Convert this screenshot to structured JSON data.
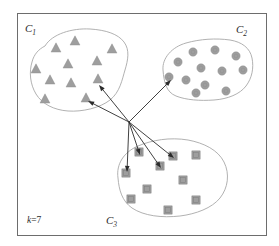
{
  "figure": {
    "k_label_prefix": "k",
    "k_label_rest": "=7",
    "frame": {
      "x": 17,
      "y": 13,
      "width": 249,
      "height": 222
    },
    "colors": {
      "frame_stroke": "#6d6d6d",
      "blob_stroke": "#a8a8a8",
      "marker_fill": "#9e9e9e",
      "arrow_stroke": "#2b2b2b",
      "background": "#ffffff",
      "text": "#2b2b2b"
    }
  },
  "labels": [
    {
      "name": "cluster-label-c1",
      "base": "C",
      "sub": "1",
      "x": 25,
      "y": 32
    },
    {
      "name": "cluster-label-c2",
      "base": "C",
      "sub": "2",
      "x": 236,
      "y": 33
    },
    {
      "name": "cluster-label-c3",
      "base": "C",
      "sub": "3",
      "x": 106,
      "y": 224
    },
    {
      "name": "k-value-label",
      "base": "k",
      "sub": "",
      "x": 27,
      "y": 223
    }
  ],
  "clusters": [
    {
      "id": "C1",
      "label": "C1",
      "shape": "triangle",
      "outline": "M 45,46 C 52,34 72,28 90,29 C 106,30 118,34 124,42 C 130,50 128,60 125,70 C 122,80 120,92 110,100 C 100,108 82,112 68,111 C 54,110 42,104 36,94 C 30,84 29,72 32,62 C 34,54 39,49 45,46 Z",
      "points": [
        {
          "x": 75,
          "y": 41
        },
        {
          "x": 56,
          "y": 48
        },
        {
          "x": 112,
          "y": 49
        },
        {
          "x": 68,
          "y": 64
        },
        {
          "x": 97,
          "y": 61
        },
        {
          "x": 36,
          "y": 69
        },
        {
          "x": 98,
          "y": 79
        },
        {
          "x": 50,
          "y": 80
        },
        {
          "x": 71,
          "y": 83
        },
        {
          "x": 45,
          "y": 99
        },
        {
          "x": 86,
          "y": 98
        }
      ]
    },
    {
      "id": "C2",
      "label": "C2",
      "shape": "circle",
      "outline": "M 163,70 C 162,58 172,47 186,43 C 200,39 216,38 230,40 C 242,42 250,48 252,58 C 254,68 252,78 246,86 C 240,94 228,99 214,100 C 200,101 186,100 176,96 C 166,92 164,82 163,70 Z",
      "points": [
        {
          "x": 193,
          "y": 52
        },
        {
          "x": 215,
          "y": 50
        },
        {
          "x": 236,
          "y": 56
        },
        {
          "x": 178,
          "y": 62
        },
        {
          "x": 201,
          "y": 68
        },
        {
          "x": 169,
          "y": 77
        },
        {
          "x": 222,
          "y": 71
        },
        {
          "x": 243,
          "y": 70
        },
        {
          "x": 186,
          "y": 80
        },
        {
          "x": 205,
          "y": 85
        },
        {
          "x": 196,
          "y": 93
        },
        {
          "x": 226,
          "y": 91
        }
      ]
    },
    {
      "id": "C3",
      "label": "C3",
      "shape": "square",
      "outline": "M 118,178 C 116,164 124,152 138,146 C 152,140 170,137 188,140 C 204,143 218,150 224,162 C 230,174 228,188 220,198 C 212,208 196,214 180,216 C 162,218 144,216 132,208 C 122,201 119,190 118,178 Z",
      "points": [
        {
          "x": 139,
          "y": 152
        },
        {
          "x": 126,
          "y": 173
        },
        {
          "x": 160,
          "y": 166
        },
        {
          "x": 173,
          "y": 156
        },
        {
          "x": 196,
          "y": 155
        },
        {
          "x": 183,
          "y": 180
        },
        {
          "x": 147,
          "y": 189
        },
        {
          "x": 131,
          "y": 199
        },
        {
          "x": 196,
          "y": 200
        },
        {
          "x": 168,
          "y": 210
        }
      ]
    }
  ],
  "centroid": {
    "x": 129,
    "y": 122
  },
  "arrows": [
    {
      "name": "arrow-to-c1-a",
      "to_x": 99,
      "to_y": 85
    },
    {
      "name": "arrow-to-c1-b",
      "to_x": 88,
      "to_y": 101
    },
    {
      "name": "arrow-to-c2-a",
      "to_x": 171,
      "to_y": 80
    },
    {
      "name": "arrow-to-c3-a",
      "to_x": 127,
      "to_y": 172
    },
    {
      "name": "arrow-to-c3-b",
      "to_x": 140,
      "to_y": 155
    },
    {
      "name": "arrow-to-c3-c",
      "to_x": 161,
      "to_y": 168
    },
    {
      "name": "arrow-to-c3-d",
      "to_x": 174,
      "to_y": 158
    }
  ],
  "chart_data": {
    "type": "scatter",
    "xlabel": "",
    "ylabel": "",
    "grid": false,
    "legend": "none",
    "annotations": [
      "C1",
      "C2",
      "C3",
      "k=7"
    ],
    "series": [
      {
        "name": "C1",
        "marker": "triangle",
        "color": "#9e9e9e",
        "count": 11,
        "x": [
          75,
          56,
          112,
          68,
          97,
          36,
          98,
          50,
          71,
          45,
          86
        ],
        "y": [
          41,
          48,
          49,
          64,
          61,
          69,
          79,
          80,
          83,
          99,
          98
        ]
      },
      {
        "name": "C2",
        "marker": "circle",
        "color": "#9e9e9e",
        "count": 12,
        "x": [
          193,
          215,
          236,
          178,
          201,
          169,
          222,
          243,
          186,
          205,
          196,
          226
        ],
        "y": [
          52,
          50,
          56,
          62,
          68,
          77,
          71,
          70,
          80,
          85,
          93,
          91
        ]
      },
      {
        "name": "C3",
        "marker": "square",
        "color": "#9e9e9e",
        "count": 10,
        "x": [
          139,
          126,
          160,
          173,
          196,
          183,
          147,
          131,
          196,
          168
        ],
        "y": [
          152,
          173,
          166,
          156,
          155,
          180,
          189,
          199,
          200,
          210
        ]
      }
    ],
    "centroid_origin": {
      "x": 129,
      "y": 122
    },
    "arrow_targets": [
      {
        "x": 99,
        "y": 85
      },
      {
        "x": 88,
        "y": 101
      },
      {
        "x": 171,
        "y": 80
      },
      {
        "x": 127,
        "y": 172
      },
      {
        "x": 140,
        "y": 155
      },
      {
        "x": 161,
        "y": 168
      },
      {
        "x": 174,
        "y": 158
      }
    ]
  }
}
